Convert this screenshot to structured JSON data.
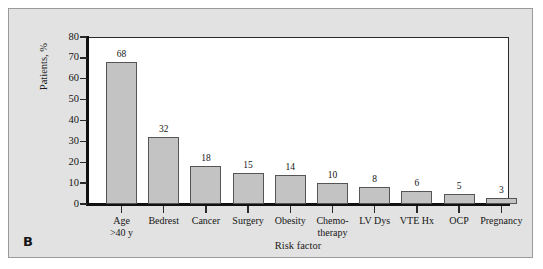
{
  "figure": {
    "panel_letter": "B",
    "panel_bg": "#e2e2e2",
    "panel_border": "#9a9a9a",
    "plot_bg": "#ffffff"
  },
  "chart_data": {
    "type": "bar",
    "title": "",
    "subtitle": "",
    "xlabel": "Risk factor",
    "ylabel": "Patients, %",
    "categories": [
      "Age\n>40 y",
      "Bedrest",
      "Cancer",
      "Surgery",
      "Obesity",
      "Chemo-\ntherapy",
      "LV Dys",
      "VTE Hx",
      "OCP",
      "Pregnancy"
    ],
    "category_lines": [
      [
        "Age",
        ">40 y"
      ],
      [
        "Bedrest",
        ""
      ],
      [
        "Cancer",
        ""
      ],
      [
        "Surgery",
        ""
      ],
      [
        "Obesity",
        ""
      ],
      [
        "Chemo-",
        "therapy"
      ],
      [
        "LV Dys",
        ""
      ],
      [
        "VTE Hx",
        ""
      ],
      [
        "OCP",
        ""
      ],
      [
        "Pregnancy",
        ""
      ]
    ],
    "values": [
      68,
      32,
      18,
      15,
      14,
      10,
      8,
      6,
      5,
      3
    ],
    "value_labels": [
      "68",
      "32",
      "18",
      "15",
      "14",
      "10",
      "8",
      "6",
      "5",
      "3"
    ],
    "ylim": [
      0,
      80
    ],
    "yticks": [
      0,
      10,
      20,
      30,
      40,
      50,
      60,
      70,
      80
    ],
    "ytick_labels": [
      "0",
      "10",
      "20",
      "30",
      "40",
      "50",
      "60",
      "70",
      "80"
    ],
    "grid": false,
    "legend": null,
    "bar_fill": "#c3c3c3",
    "bar_edge": "#555555",
    "axis_color": "#111111"
  }
}
